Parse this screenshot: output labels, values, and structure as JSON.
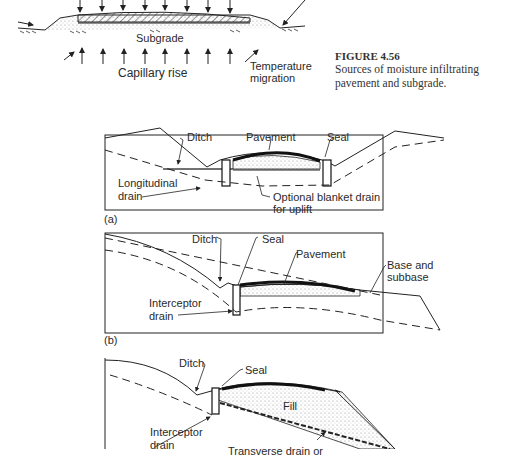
{
  "figure": {
    "title": "FIGURE 4.56",
    "caption": "Sources of moisture infiltrating pavement and subgrade."
  },
  "top_diagram": {
    "labels": {
      "subgrade": "Subgrade",
      "capillary_rise": "Capillary rise",
      "temperature_migration_1": "Temperature",
      "temperature_migration_2": "migration"
    }
  },
  "panel_a": {
    "tag": "(a)",
    "labels": {
      "ditch": "Ditch",
      "pavement": "Pavement",
      "seal": "Seal",
      "longitudinal_drain_1": "Longitudinal",
      "longitudinal_drain_2": "drain",
      "blanket_drain_1": "Optional blanket drain",
      "blanket_drain_2": "for uplift"
    }
  },
  "panel_b": {
    "tag": "(b)",
    "labels": {
      "ditch": "Ditch",
      "seal": "Seal",
      "pavement": "Pavement",
      "base_1": "Base and",
      "base_2": "subbase",
      "interceptor_1": "Interceptor",
      "interceptor_2": "drain"
    }
  },
  "panel_c": {
    "labels": {
      "ditch": "Ditch",
      "seal": "Seal",
      "fill": "Fill",
      "interceptor_1": "Interceptor",
      "interceptor_2": "drain",
      "transverse": "Transverse drain or"
    }
  }
}
